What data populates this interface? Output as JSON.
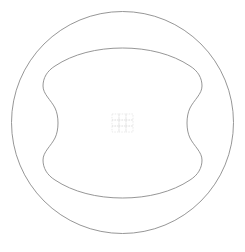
{
  "canvas": {
    "width": 245,
    "height": 252,
    "background_color": "#ffffff",
    "title": "Leather hide pattern inside circular die outline"
  },
  "shapes": {
    "outer_circle": {
      "name": "outer-circle",
      "kind": "circle",
      "center_x": 122.5,
      "center_y": 122.5,
      "radius": 111,
      "stroke_color": "#8a8a8a",
      "stroke_width": 0.9,
      "fill": "none"
    },
    "inner_outline": {
      "name": "cushion-outline",
      "kind": "closed-curve",
      "description": "rounded square with concave sides and flared corners",
      "bounds": {
        "left": 43,
        "top": 48,
        "right": 202,
        "bottom": 198
      },
      "stroke_color": "#8a8a8a",
      "stroke_width": 0.9,
      "fill": "none",
      "path": "M 122.5 48 C 148 48 172 54 190 66 C 198 71 202 78 202 86 C 202 94 194 100 190 108 C 186 116 186 130 190 138 C 194 146 202 152 202 160 C 202 168 198 175 190 180 C 172 192 148 198 122.5 198 C 97 198 73 192 55 180 C 47 175 43 168 43 160 C 43 152 51 146 55 138 C 59 130 59 116 55 108 C 51 100 43 94 43 86 C 43 78 47 71 55 66 C 73 54 97 48 122.5 48 Z"
    },
    "center_grid": {
      "name": "center-grid-mark",
      "kind": "grid",
      "rows": 3,
      "columns": 3,
      "origin_x": 112,
      "origin_y": 114,
      "cell_width": 7,
      "cell_height": 6,
      "stroke_color": "#dcdcdc",
      "stroke_width": 0.6,
      "dash_pattern": "1.5 1.2",
      "fill": "none"
    }
  }
}
